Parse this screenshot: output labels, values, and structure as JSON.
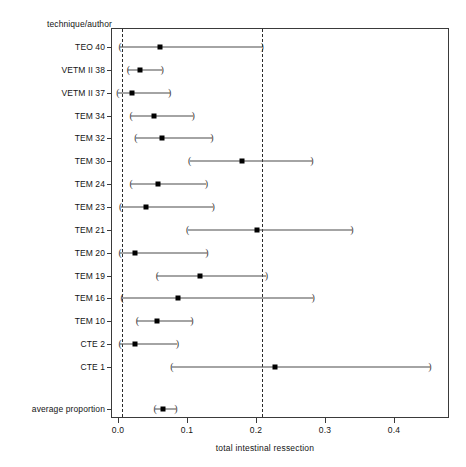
{
  "chart_data": {
    "type": "scatter",
    "subtype": "forest-plot",
    "title": "",
    "ylabel": "technique/author",
    "xlabel": "total intestinal ressection",
    "xlim": [
      -0.025,
      0.478
    ],
    "xticks": [
      0.0,
      0.1,
      0.2,
      0.3,
      0.4
    ],
    "xticklabels": [
      "0.0",
      "0.1",
      "0.2",
      "0.3",
      "0.4"
    ],
    "grid": false,
    "legend": null,
    "reference_lines": [
      {
        "name": "lower-reference-line",
        "x": 0.006,
        "style": "dashed"
      },
      {
        "name": "upper-reference-line",
        "x": 0.209,
        "style": "dashed"
      }
    ],
    "categories": [
      "TEO 40",
      "VETM II 38",
      "VETM II 37",
      "TEM 34",
      "TEM 32",
      "TEM 30",
      "TEM 24",
      "TEM 23",
      "TEM 21",
      "TEM 20",
      "TEM 19",
      "TEM 16",
      "TEM 10",
      "CTE 2",
      "CTE 1",
      "average proportion"
    ],
    "series": [
      {
        "name": "proportion",
        "values": [
          0.061,
          0.032,
          0.02,
          0.052,
          0.064,
          0.18,
          0.058,
          0.041,
          0.201,
          0.025,
          0.119,
          0.087,
          0.057,
          0.025,
          0.228,
          0.065
        ]
      },
      {
        "name": "ci_lower",
        "values": [
          0.003,
          0.015,
          0.0,
          0.019,
          0.026,
          0.104,
          0.019,
          0.004,
          0.101,
          0.003,
          0.057,
          0.006,
          0.028,
          0.003,
          0.078,
          0.054
        ]
      },
      {
        "name": "ci_upper",
        "values": [
          0.209,
          0.064,
          0.075,
          0.109,
          0.136,
          0.281,
          0.128,
          0.138,
          0.339,
          0.129,
          0.215,
          0.283,
          0.107,
          0.086,
          0.452,
          0.084
        ]
      }
    ],
    "rows": [
      {
        "label": "TEO 40",
        "estimate": 0.061,
        "lower": 0.003,
        "upper": 0.209
      },
      {
        "label": "VETM II 38",
        "estimate": 0.032,
        "lower": 0.015,
        "upper": 0.064
      },
      {
        "label": "VETM II 37",
        "estimate": 0.02,
        "lower": 0.0,
        "upper": 0.075
      },
      {
        "label": "TEM 34",
        "estimate": 0.052,
        "lower": 0.019,
        "upper": 0.109
      },
      {
        "label": "TEM 32",
        "estimate": 0.064,
        "lower": 0.026,
        "upper": 0.136
      },
      {
        "label": "TEM 30",
        "estimate": 0.18,
        "lower": 0.104,
        "upper": 0.281
      },
      {
        "label": "TEM 24",
        "estimate": 0.058,
        "lower": 0.019,
        "upper": 0.128
      },
      {
        "label": "TEM 23",
        "estimate": 0.041,
        "lower": 0.004,
        "upper": 0.138
      },
      {
        "label": "TEM 21",
        "estimate": 0.201,
        "lower": 0.101,
        "upper": 0.339
      },
      {
        "label": "TEM 20",
        "estimate": 0.025,
        "lower": 0.003,
        "upper": 0.129
      },
      {
        "label": "TEM 19",
        "estimate": 0.119,
        "lower": 0.057,
        "upper": 0.215
      },
      {
        "label": "TEM 16",
        "estimate": 0.087,
        "lower": 0.006,
        "upper": 0.283
      },
      {
        "label": "TEM 10",
        "estimate": 0.057,
        "lower": 0.028,
        "upper": 0.107
      },
      {
        "label": "CTE 2",
        "estimate": 0.025,
        "lower": 0.003,
        "upper": 0.086
      },
      {
        "label": "CTE 1",
        "estimate": 0.228,
        "lower": 0.078,
        "upper": 0.452
      },
      {
        "label": "average proportion",
        "estimate": 0.065,
        "lower": 0.054,
        "upper": 0.084
      }
    ],
    "marker": "filled-square",
    "cap_style": "parenthesis"
  },
  "colors": {
    "axis": "#3a3a3a",
    "marker": "#000000",
    "ci": "#4a4a4a",
    "reference": "#2b2b2b",
    "text": "#141414",
    "background": "#ffffff"
  }
}
